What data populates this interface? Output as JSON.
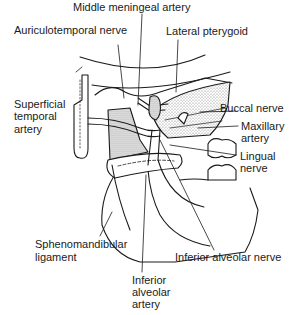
{
  "figure": {
    "type": "anatomical line drawing"
  },
  "labels": {
    "middle_meningeal_artery": "Middle meningeal artery",
    "auriculotemporal_nerve": "Auriculotemporal nerve",
    "lateral_pterygoid": "Lateral pterygoid",
    "superficial_temporal_artery": [
      "Superficial",
      "temporal",
      "artery"
    ],
    "buccal_nerve": "Buccal nerve",
    "maxillary_artery": [
      "Maxillary",
      "artery"
    ],
    "lingual_nerve": [
      "Lingual",
      "nerve"
    ],
    "sphenomandibular_ligament": [
      "Sphenomandibular",
      "ligament"
    ],
    "inferior_alveolar_nerve": "Inferior alveolar nerve",
    "inferior_alveolar_artery": [
      "Inferior",
      "alveolar",
      "artery"
    ]
  },
  "colors": {
    "ink": "#1a1a1a",
    "stipple": "#9a9a9a",
    "background": "#ffffff"
  }
}
